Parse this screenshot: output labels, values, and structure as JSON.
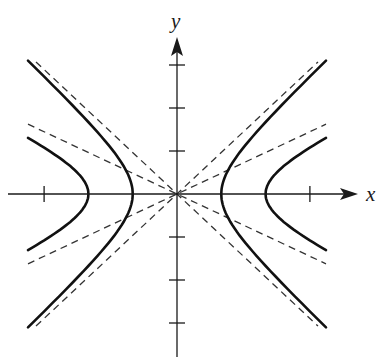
{
  "figure": {
    "title": "",
    "colors": {
      "curve": "#111111",
      "asymptote": "#333333",
      "axis": "#1a1a1a"
    }
  },
  "axes": {
    "x_label": "x",
    "y_label": "y",
    "x_ticks": [
      -3,
      3
    ],
    "y_ticks": [
      -3,
      -2,
      -1,
      1,
      2,
      3
    ]
  },
  "chart_data": {
    "type": "line",
    "title": "",
    "xlabel": "x",
    "ylabel": "y",
    "xlim": [
      -4,
      4.4
    ],
    "ylim": [
      -3.8,
      3.9
    ],
    "grid": false,
    "legend": "none",
    "series": [
      {
        "name": "hyperbola x^2 - y^2 = 1",
        "style": "solid",
        "a": 1,
        "b": 1,
        "vertices": [
          [
            -1,
            0
          ],
          [
            1,
            0
          ]
        ]
      },
      {
        "name": "hyperbola x^2/4 - y^2 = 1",
        "style": "solid",
        "a": 2,
        "b": 1,
        "vertices": [
          [
            -2,
            0
          ],
          [
            2,
            0
          ]
        ]
      },
      {
        "name": "asymptote y = x",
        "style": "dashed",
        "slope": 1
      },
      {
        "name": "asymptote y = -x",
        "style": "dashed",
        "slope": -1
      },
      {
        "name": "asymptote y = x/2",
        "style": "dashed",
        "slope": 0.5
      },
      {
        "name": "asymptote y = -x/2",
        "style": "dashed",
        "slope": -0.5
      }
    ]
  }
}
